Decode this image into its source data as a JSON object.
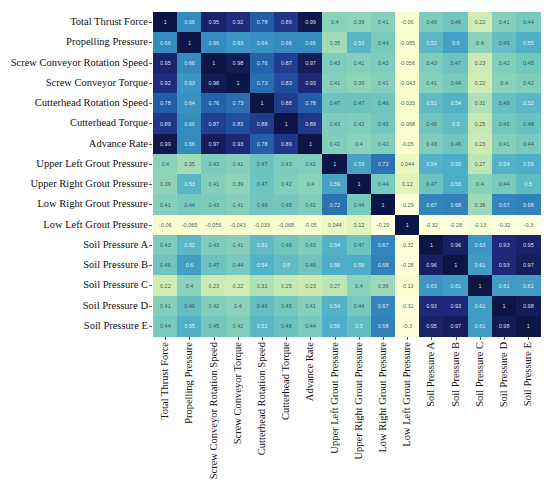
{
  "chart_data": {
    "type": "heatmap",
    "title": "",
    "xlabel": "",
    "ylabel": "",
    "colormap": "YlGnBu",
    "value_range": [
      -0.32,
      1
    ],
    "grid": false,
    "legend": "none",
    "labels": [
      "Total Thrust Force",
      "Propelling Pressure",
      "Screw Conveyor Rotation Speed",
      "Screw Conveyor Torque",
      "Cutterhead Rotation Speed",
      "Cutterhead Torque",
      "Advance Rate",
      "Upper Left Grout Pressure",
      "Upper Right Grout Pressure",
      "Low Right Grout Pressure",
      "Low Left Grout Pressure",
      "Soil Pressure A",
      "Soil Pressure B",
      "Soil Pressure C",
      "Soil Pressure D",
      "Soil Pressure E"
    ],
    "matrix": [
      [
        1,
        0.66,
        0.95,
        0.92,
        0.78,
        0.89,
        0.99,
        0.4,
        0.39,
        0.41,
        -0.06,
        0.43,
        0.46,
        0.22,
        0.41,
        0.44
      ],
      [
        0.66,
        1,
        0.66,
        0.63,
        0.64,
        0.66,
        0.66,
        0.35,
        0.53,
        0.44,
        -0.065,
        0.52,
        0.6,
        0.4,
        0.49,
        0.55
      ],
      [
        0.95,
        0.66,
        1,
        0.98,
        0.76,
        0.87,
        0.97,
        0.43,
        0.41,
        0.43,
        -0.056,
        0.43,
        0.47,
        0.23,
        0.42,
        0.45
      ],
      [
        0.92,
        0.63,
        0.98,
        1,
        0.73,
        0.83,
        0.93,
        0.41,
        0.39,
        0.41,
        -0.043,
        0.41,
        0.44,
        0.22,
        0.4,
        0.42
      ],
      [
        0.78,
        0.64,
        0.76,
        0.73,
        1,
        0.88,
        0.78,
        0.47,
        0.47,
        0.46,
        -0.033,
        0.51,
        0.54,
        0.31,
        0.49,
        0.52
      ],
      [
        0.89,
        0.66,
        0.87,
        0.83,
        0.88,
        1,
        0.89,
        0.43,
        0.42,
        0.45,
        -0.068,
        0.46,
        0.5,
        0.25,
        0.45,
        0.48
      ],
      [
        0.99,
        0.66,
        0.97,
        0.93,
        0.78,
        0.89,
        1,
        0.42,
        0.4,
        0.42,
        -0.05,
        0.43,
        0.46,
        0.23,
        0.41,
        0.44
      ],
      [
        0.4,
        0.35,
        0.43,
        0.41,
        0.47,
        0.43,
        0.42,
        1,
        0.59,
        0.72,
        0.044,
        0.54,
        0.56,
        0.27,
        0.54,
        0.56
      ],
      [
        0.39,
        0.53,
        0.41,
        0.39,
        0.47,
        0.42,
        0.4,
        0.59,
        1,
        0.44,
        0.12,
        0.47,
        0.56,
        0.4,
        0.44,
        0.5
      ],
      [
        0.41,
        0.44,
        0.43,
        0.41,
        0.46,
        0.45,
        0.42,
        0.72,
        0.44,
        1,
        -0.29,
        0.67,
        0.68,
        0.36,
        0.67,
        0.68
      ],
      [
        -0.06,
        -0.065,
        -0.056,
        -0.043,
        -0.033,
        -0.068,
        -0.05,
        0.044,
        0.12,
        -0.29,
        1,
        -0.32,
        -0.28,
        -0.13,
        -0.32,
        -0.3
      ],
      [
        0.43,
        0.52,
        0.43,
        0.41,
        0.51,
        0.46,
        0.43,
        0.54,
        0.47,
        0.67,
        -0.32,
        1,
        0.96,
        0.63,
        0.93,
        0.95
      ],
      [
        0.46,
        0.6,
        0.47,
        0.44,
        0.54,
        0.5,
        0.46,
        0.56,
        0.56,
        0.68,
        -0.28,
        0.96,
        1,
        0.61,
        0.93,
        0.97
      ],
      [
        0.22,
        0.4,
        0.23,
        0.22,
        0.31,
        0.25,
        0.23,
        0.27,
        0.4,
        0.36,
        -0.13,
        0.63,
        0.61,
        1,
        0.61,
        0.61
      ],
      [
        0.41,
        0.49,
        0.42,
        0.4,
        0.49,
        0.45,
        0.41,
        0.54,
        0.44,
        0.67,
        -0.32,
        0.93,
        0.93,
        0.61,
        1,
        0.98
      ],
      [
        0.44,
        0.55,
        0.45,
        0.42,
        0.52,
        0.48,
        0.44,
        0.56,
        0.5,
        0.68,
        -0.3,
        0.95,
        0.97,
        0.61,
        0.98,
        1
      ]
    ]
  },
  "layout": {
    "grid_left": 153,
    "grid_top": 12,
    "cell_w": 24.2,
    "cell_h": 20.25
  }
}
